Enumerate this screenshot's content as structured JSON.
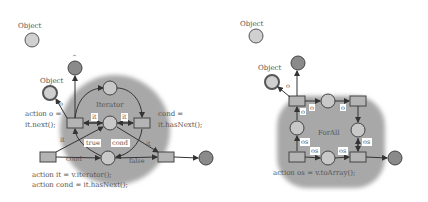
{
  "diagrams": [
    {
      "name": "iterator",
      "object_top_label": "Object",
      "object_input_label": "Object",
      "output_label": "^",
      "region_label": "Iterator",
      "arc_o": "o",
      "action_left_line1": "action o =",
      "action_left_line2": "it.next();",
      "cond_right_line1": "cond =",
      "cond_right_line2": "it.hasNext();",
      "edge_it_left": "it",
      "edge_it_right": "it",
      "edge_it_bl": "it",
      "edge_it_br": "it",
      "edge_true": "true",
      "edge_cond_mid": "cond",
      "edge_cond_bottom": "cond",
      "edge_false": "false",
      "action_bottom_line1": "action it = v.iterator();",
      "action_bottom_line2": "action cond = it.hasNext();"
    },
    {
      "name": "forall",
      "object_top_label": "Object",
      "object_input_label": "Object",
      "region_label": "ForAll",
      "arc_o": "o",
      "edge_o1": "o",
      "edge_o2": "o",
      "edge_o3": "o",
      "edge_os1": "os",
      "edge_os2": "os",
      "edge_os3": "os",
      "edge_os4": "os",
      "action_bottom": "action os = v.toArray();"
    }
  ],
  "colors": {
    "region": "#a8a8a8",
    "place_fill": "#c8c8c8",
    "output_place_fill": "#8a8a8a",
    "transition_fill": "#b4b4b4",
    "stroke": "#444444",
    "text": "#555555"
  }
}
